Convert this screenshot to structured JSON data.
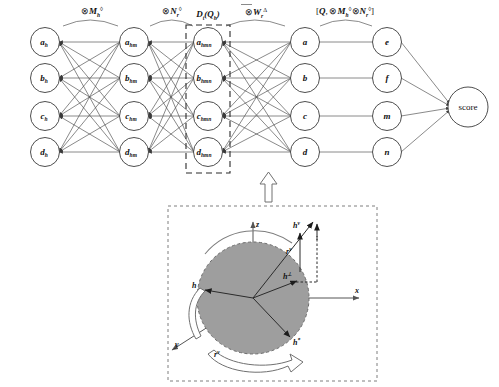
{
  "figure": {
    "width": 499,
    "height": 387,
    "background": "#ffffff"
  },
  "network": {
    "layers": [
      {
        "id": "layer-h",
        "name": "input-layer",
        "nodes": [
          {
            "base": "a",
            "sub": "h"
          },
          {
            "base": "b",
            "sub": "h"
          },
          {
            "base": "c",
            "sub": "h"
          },
          {
            "base": "d",
            "sub": "h"
          }
        ]
      },
      {
        "id": "layer-hm",
        "name": "hidden-layer-1",
        "nodes": [
          {
            "base": "a",
            "sub": "hm"
          },
          {
            "base": "b",
            "sub": "hm"
          },
          {
            "base": "c",
            "sub": "hm"
          },
          {
            "base": "d",
            "sub": "hm"
          }
        ]
      },
      {
        "id": "layer-hmn",
        "name": "hidden-layer-2",
        "nodes": [
          {
            "base": "a",
            "sub": "hmn"
          },
          {
            "base": "b",
            "sub": "hmn"
          },
          {
            "base": "c",
            "sub": "hmn"
          },
          {
            "base": "d",
            "sub": "hmn"
          }
        ]
      },
      {
        "id": "layer-abcd",
        "name": "hidden-layer-3",
        "nodes": [
          {
            "base": "a",
            "sub": ""
          },
          {
            "base": "b",
            "sub": ""
          },
          {
            "base": "c",
            "sub": ""
          },
          {
            "base": "d",
            "sub": ""
          }
        ]
      },
      {
        "id": "layer-efmn",
        "name": "hidden-layer-4",
        "nodes": [
          {
            "base": "e",
            "sub": ""
          },
          {
            "base": "f",
            "sub": ""
          },
          {
            "base": "m",
            "sub": ""
          },
          {
            "base": "n",
            "sub": ""
          }
        ]
      }
    ],
    "output_node": {
      "id": "score-node",
      "label": "score"
    },
    "operators": [
      {
        "id": "op-mh",
        "symbol": "⊗",
        "base": "M",
        "sub": "h",
        "sup": "◊",
        "overbar": false
      },
      {
        "id": "op-nr",
        "symbol": "⊗",
        "base": "N",
        "sub": "r",
        "sup": "◊",
        "overbar": false
      },
      {
        "id": "op-dq",
        "symbol": "",
        "base": "D",
        "sub": "t",
        "sup": "",
        "paren": "(Qₕ)",
        "text": "Dₜ(Qₕ)"
      },
      {
        "id": "op-wr",
        "symbol": "⊗",
        "base": "W",
        "sub": "r",
        "sup": "Δ",
        "overbar": true
      },
      {
        "id": "op-bracket",
        "text": "[Q, ⊗Mₕ◊, ⊗Nᵣ◊]"
      }
    ]
  },
  "rotation_diagram": {
    "name": "quaternion-rotation-panel",
    "axes": [
      {
        "id": "axis-x",
        "label": "x"
      },
      {
        "id": "axis-y",
        "label": "y"
      },
      {
        "id": "axis-z",
        "label": "z"
      }
    ],
    "vectors": [
      {
        "id": "vec-h",
        "base": "h",
        "sup": ""
      },
      {
        "id": "vec-h-perp",
        "base": "h",
        "sup": "⊥"
      },
      {
        "id": "vec-h-v",
        "base": "h",
        "sup": "v"
      },
      {
        "id": "vec-h-star",
        "base": "h",
        "sup": "*"
      },
      {
        "id": "vec-r-v",
        "base": "r",
        "sup": "v"
      },
      {
        "id": "vec-r-bottom",
        "base": "r",
        "sup": "v"
      }
    ],
    "colors": {
      "sphere_fill": "#9e9e9e",
      "sphere_stroke": "#6b6b6b",
      "axis": "#555555",
      "dash_border": "#6f6f6f"
    }
  }
}
